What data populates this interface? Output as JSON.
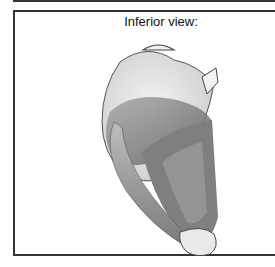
{
  "figure": {
    "caption": "Inferior view:",
    "colors": {
      "frame": "#333333",
      "background": "#ffffff",
      "muscle_dark": "#6e6e6e",
      "muscle_mid": "#9a9a9a",
      "globe_light": "#e4e4e4"
    }
  }
}
